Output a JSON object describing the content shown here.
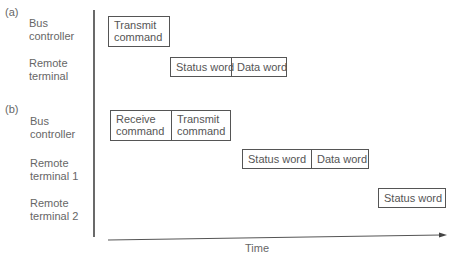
{
  "panel_a": {
    "tag": "(a)",
    "rows": [
      {
        "label_1": "Bus",
        "label_2": "controller"
      },
      {
        "label_1": "Remote",
        "label_2": "terminal"
      }
    ],
    "boxes": {
      "bc_transmit_1": "Transmit",
      "bc_transmit_2": "command",
      "rt_status": "Status word",
      "rt_data": "Data word"
    }
  },
  "panel_b": {
    "tag": "(b)",
    "rows": [
      {
        "label_1": "Bus",
        "label_2": "controller"
      },
      {
        "label_1": "Remote",
        "label_2": "terminal 1"
      },
      {
        "label_1": "Remote",
        "label_2": "terminal 2"
      }
    ],
    "boxes": {
      "bc_receive_1": "Receive",
      "bc_receive_2": "command",
      "bc_transmit_1": "Transmit",
      "bc_transmit_2": "command",
      "rt1_status": "Status word",
      "rt1_data": "Data word",
      "rt2_status": "Status word"
    }
  },
  "axis": {
    "x_label": "Time"
  }
}
